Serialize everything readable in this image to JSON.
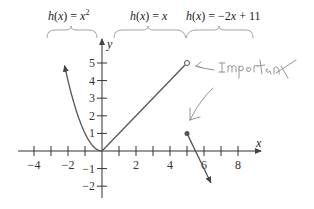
{
  "chart_data": {
    "type": "line",
    "title": "",
    "xlabel": "x",
    "ylabel": "y",
    "xlim": [
      -5,
      9
    ],
    "ylim": [
      -2.5,
      6
    ],
    "x_ticks": [
      -4,
      -3,
      -2,
      -1,
      1,
      2,
      3,
      4,
      5,
      6,
      7,
      8
    ],
    "x_tick_labels": [
      {
        "value": -4,
        "label": "−4"
      },
      {
        "value": -2,
        "label": "−2"
      },
      {
        "value": 2,
        "label": "2"
      },
      {
        "value": 4,
        "label": "4"
      },
      {
        "value": 6,
        "label": "6"
      },
      {
        "value": 8,
        "label": "8"
      }
    ],
    "y_ticks": [
      -2,
      -1,
      1,
      2,
      3,
      4,
      5
    ],
    "y_tick_labels": [
      {
        "value": 5,
        "label": "5"
      },
      {
        "value": 4,
        "label": "4"
      },
      {
        "value": 3,
        "label": "3"
      },
      {
        "value": 2,
        "label": "2"
      },
      {
        "value": 1,
        "label": "1"
      },
      {
        "value": -1,
        "label": "−1"
      },
      {
        "value": -2,
        "label": "−2"
      }
    ],
    "series": [
      {
        "name": "h(x) = x^2",
        "label": "h(x) = x²",
        "domain": [
          -2.2,
          0
        ],
        "kind": "parabola",
        "end_arrow": "left"
      },
      {
        "name": "h(x) = x",
        "label": "h(x) = x",
        "domain": [
          0,
          5
        ],
        "kind": "linear",
        "end_point": {
          "x": 5,
          "y": 5,
          "style": "open"
        }
      },
      {
        "name": "h(x) = -2x + 11",
        "label": "h(x) = −2x + 11",
        "domain": [
          5,
          6.4
        ],
        "kind": "linear",
        "start_point": {
          "x": 5,
          "y": 1,
          "style": "closed"
        },
        "end_arrow": "right"
      }
    ],
    "annotations": [
      {
        "text": "Important",
        "style": "handwritten",
        "points_to": {
          "x": 5,
          "y": 5
        }
      },
      {
        "text": "",
        "style": "handwritten-arrow",
        "points_to": {
          "x": 5,
          "y": 1
        }
      }
    ],
    "grid": false
  },
  "colors": {
    "curve": "#555555",
    "axis": "#333333",
    "handwriting": "#8a8a8a"
  }
}
